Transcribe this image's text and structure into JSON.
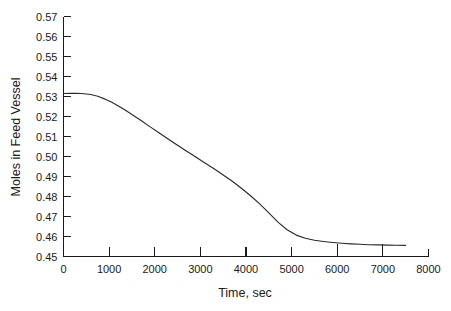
{
  "chart_data": {
    "type": "line",
    "title": "",
    "xlabel": "Time, sec",
    "ylabel": "Moles in Feed Vessel",
    "xlim": [
      0,
      8000
    ],
    "ylim": [
      0.45,
      0.57
    ],
    "grid": false,
    "legend": null,
    "x_ticks": [
      0,
      1000,
      2000,
      3000,
      4000,
      5000,
      6000,
      7000,
      8000
    ],
    "x_tick_labels": [
      "0",
      "1000",
      "2000",
      "3000",
      "4000",
      "5000",
      "6000",
      "7000",
      "8000"
    ],
    "y_ticks": [
      0.45,
      0.46,
      0.47,
      0.48,
      0.49,
      0.5,
      0.51,
      0.52,
      0.53,
      0.54,
      0.55,
      0.56,
      0.57
    ],
    "y_tick_labels": [
      "0.45",
      "0.46",
      "0.47",
      "0.48",
      "0.49",
      "0.50",
      "0.51",
      "0.52",
      "0.53",
      "0.54",
      "0.55",
      "0.56",
      "0.57"
    ],
    "series": [
      {
        "name": "Moles in Feed Vessel",
        "color": "#2a2a2a",
        "x": [
          0,
          150,
          300,
          450,
          600,
          750,
          900,
          1050,
          1200,
          1350,
          1500,
          1700,
          1900,
          2100,
          2300,
          2500,
          2700,
          2900,
          3100,
          3300,
          3500,
          3700,
          3900,
          4100,
          4300,
          4500,
          4700,
          4900,
          5100,
          5300,
          5500,
          5700,
          5900,
          6100,
          6300,
          6500,
          6700,
          6900,
          7100,
          7300,
          7500
        ],
        "y": [
          0.5315,
          0.5316,
          0.5316,
          0.5314,
          0.531,
          0.5301,
          0.5288,
          0.5272,
          0.5253,
          0.5232,
          0.521,
          0.518,
          0.5148,
          0.5117,
          0.5086,
          0.5056,
          0.5026,
          0.4997,
          0.4968,
          0.4939,
          0.4908,
          0.4876,
          0.4841,
          0.4804,
          0.4763,
          0.4718,
          0.4672,
          0.4634,
          0.4607,
          0.4591,
          0.4581,
          0.4575,
          0.457,
          0.4566,
          0.4563,
          0.4561,
          0.4559,
          0.4558,
          0.4557,
          0.4556,
          0.4556
        ]
      }
    ]
  }
}
